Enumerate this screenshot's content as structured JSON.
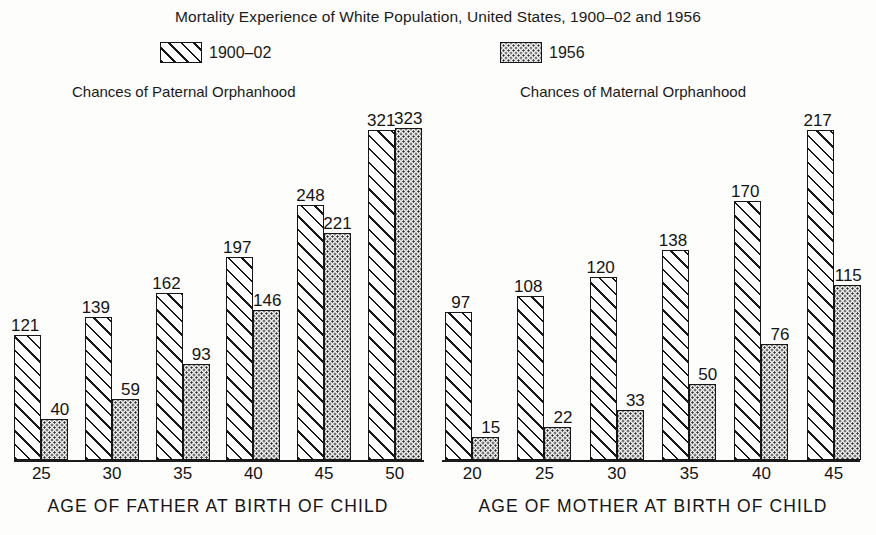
{
  "chart_data": {
    "type": "bar",
    "title": "Mortality Experience of White Population, United States, 1900–02 and 1956",
    "legend": [
      {
        "label": "1900–02",
        "pattern": "diagonal-hatch"
      },
      {
        "label": "1956",
        "pattern": "stipple-dots"
      }
    ],
    "legend_position": "top-center",
    "grid": false,
    "panels": [
      {
        "subtitle": "Chances of Paternal Orphanhood",
        "xlabel": "AGE OF FATHER AT BIRTH OF CHILD",
        "ylabel": "",
        "categories": [
          "25",
          "30",
          "35",
          "40",
          "45",
          "50"
        ],
        "ylim": [
          0,
          340
        ],
        "series": [
          {
            "name": "1900–02",
            "values": [
              121,
              139,
              162,
              197,
              248,
              321
            ]
          },
          {
            "name": "1956",
            "values": [
              40,
              59,
              93,
              146,
              221,
              323
            ]
          }
        ]
      },
      {
        "subtitle": "Chances of Maternal Orphanhood",
        "xlabel": "AGE OF MOTHER AT BIRTH OF CHILD",
        "ylabel": "",
        "categories": [
          "20",
          "25",
          "30",
          "35",
          "40",
          "45"
        ],
        "ylim": [
          0,
          230
        ],
        "series": [
          {
            "name": "1900–02",
            "values": [
              97,
              108,
              120,
              138,
              170,
              217
            ]
          },
          {
            "name": "1956",
            "values": [
              15,
              22,
              33,
              50,
              76,
              115
            ]
          }
        ]
      }
    ],
    "colors": {
      "ink": "#161616",
      "background": "#fdfdfc",
      "dot_fill": "#efefef"
    }
  }
}
